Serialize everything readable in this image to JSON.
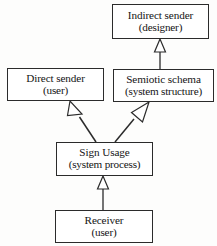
{
  "diagram": {
    "type": "uml-generalization",
    "background_color": "#fdfdfc",
    "line_color": "#2b2b2b",
    "text_color": "#141414",
    "nodes": [
      {
        "id": "indirect-sender",
        "line1": "Indirect sender",
        "line2": "(designer)",
        "x": 112,
        "y": 4,
        "w": 97,
        "h": 35
      },
      {
        "id": "direct-sender",
        "line1": "Direct sender",
        "line2": "(user)",
        "x": 7,
        "y": 68,
        "w": 97,
        "h": 33
      },
      {
        "id": "semiotic-schema",
        "line1": "Semiotic schema",
        "line2": "(system structure)",
        "x": 113,
        "y": 69,
        "w": 101,
        "h": 33
      },
      {
        "id": "sign-usage",
        "line1": "Sign Usage",
        "line2": "(system process)",
        "x": 56,
        "y": 142,
        "w": 97,
        "h": 34
      },
      {
        "id": "receiver",
        "line1": "Receiver",
        "line2": "(user)",
        "x": 55,
        "y": 210,
        "w": 98,
        "h": 33
      }
    ],
    "edges": [
      {
        "id": "semiotic-schema-to-indirect-sender",
        "from": "semiotic-schema",
        "to": "indirect-sender",
        "arrow": "hollow-triangle",
        "orientation": "vertical"
      },
      {
        "id": "sign-usage-to-direct-sender",
        "from": "sign-usage",
        "to": "direct-sender",
        "arrow": "hollow-triangle",
        "orientation": "diagonal-up-left"
      },
      {
        "id": "sign-usage-to-semiotic-schema",
        "from": "sign-usage",
        "to": "semiotic-schema",
        "arrow": "hollow-triangle",
        "orientation": "diagonal-up-right"
      },
      {
        "id": "receiver-to-sign-usage",
        "from": "receiver",
        "to": "sign-usage",
        "arrow": "hollow-triangle",
        "orientation": "vertical"
      }
    ]
  }
}
